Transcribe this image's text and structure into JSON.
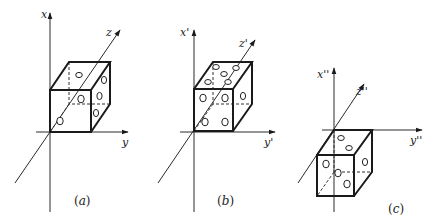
{
  "figure": {
    "panels": [
      {
        "id": "a",
        "caption": "(a)",
        "caption_letter": "a",
        "axes": {
          "x": "x",
          "y": "y",
          "z": "z"
        },
        "faces_visible": {
          "front": 2,
          "top": 1,
          "right": 3
        }
      },
      {
        "id": "b",
        "caption": "(b)",
        "caption_letter": "b",
        "axes": {
          "x": "x'",
          "y": "y'",
          "z": "z'"
        },
        "faces_visible": {
          "front": 4,
          "top": 5,
          "right": 1
        }
      },
      {
        "id": "c",
        "caption": "(c)",
        "caption_letter": "c",
        "axes": {
          "x": "x''",
          "y": "y''",
          "z": "z''"
        },
        "faces_visible": {
          "front": 3,
          "top": 2,
          "right": 1
        }
      }
    ],
    "colors": {
      "ink": "#1a1a1a",
      "background": "#ffffff"
    }
  }
}
